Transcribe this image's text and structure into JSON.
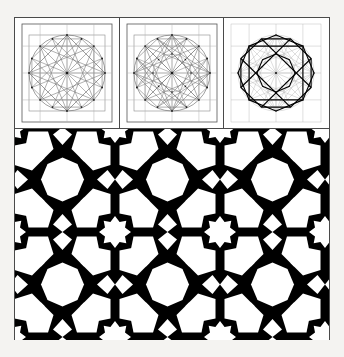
{
  "plate": {
    "title": "Geometric construction and resulting star tessellation",
    "background_color": "#f4f3f1",
    "paper_color": "#ffffff",
    "ink_color": "#000000",
    "frame_color": "#4a4a4a",
    "width_px": 344,
    "height_px": 357
  },
  "figure": {
    "frame": {
      "x": 14,
      "y": 17,
      "width": 316,
      "height": 323
    },
    "construction_row": {
      "x": 0,
      "y": 0,
      "width": 314,
      "height": 110,
      "panel_count": 3
    },
    "tiling_region": {
      "x": 0,
      "y": 110,
      "width": 314,
      "height": 212
    }
  },
  "construction_panels": [
    {
      "index": 1,
      "label": "step-1-circle-and-radii",
      "description": "Circle inscribed in a square, divided by 16 radii, with inscribed squares and chord web",
      "divisions": 16,
      "show_circle": true,
      "show_square": true,
      "show_radii": true,
      "show_inscribed_squares": true,
      "show_chords": true,
      "show_chord_web": false,
      "show_bold_pattern": false,
      "node_dots": true,
      "line_color": "#6e6e6e",
      "bold_color": "#000000"
    },
    {
      "index": 2,
      "label": "step-2-chord-web",
      "description": "Same circle with a denser web of chords connecting division points, forming overlapping star polygons",
      "divisions": 16,
      "show_circle": true,
      "show_square": true,
      "show_radii": true,
      "show_inscribed_squares": true,
      "show_chords": true,
      "show_chord_web": true,
      "show_bold_pattern": false,
      "node_dots": true,
      "line_color": "#6e6e6e",
      "bold_color": "#000000"
    },
    {
      "index": 3,
      "label": "step-3-extracted-pattern",
      "description": "Final pattern lines picked out in bold over the faint construction web: octagon, eight-point star and interlaced polygons",
      "divisions": 16,
      "show_circle": true,
      "show_square": true,
      "show_radii": true,
      "show_inscribed_squares": true,
      "show_chords": true,
      "show_chord_web": true,
      "show_bold_pattern": true,
      "node_dots": true,
      "line_color": "#9a9a9a",
      "bold_color": "#000000"
    }
  ],
  "tiling": {
    "label": "black-and-white-star-tessellation",
    "description": "Repeating Islamic star tiling in solid black and white derived from the construction above",
    "cell_size_px": 105,
    "columns": 3,
    "rows": 2,
    "foreground_color": "#000000",
    "background_color": "#ffffff",
    "motifs": [
      "large-white-octagon",
      "white-eight-point-star",
      "white-pentagon",
      "black-six-point-star",
      "white-kite"
    ]
  }
}
